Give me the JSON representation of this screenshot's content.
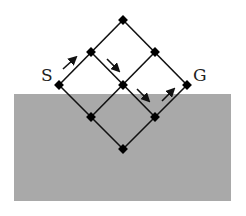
{
  "diagram": {
    "labels": {
      "start": "S",
      "goal": "G"
    },
    "colors": {
      "region": "#a9a9a9",
      "line": "#111111",
      "node": "#000000",
      "background": "#ffffff"
    },
    "region": {
      "x": 14,
      "y": 94,
      "width": 217,
      "height": 107
    },
    "nodes": [
      {
        "id": "top",
        "x": 123,
        "y": 20
      },
      {
        "id": "ml",
        "x": 91,
        "y": 52
      },
      {
        "id": "mr",
        "x": 155,
        "y": 52
      },
      {
        "id": "S",
        "x": 59,
        "y": 85
      },
      {
        "id": "c",
        "x": 123,
        "y": 85
      },
      {
        "id": "G",
        "x": 187,
        "y": 85
      },
      {
        "id": "ll",
        "x": 91,
        "y": 117
      },
      {
        "id": "lr",
        "x": 155,
        "y": 117
      },
      {
        "id": "bot",
        "x": 123,
        "y": 149
      }
    ],
    "path_arrows": [
      "S→ml",
      "ml→c",
      "c→lr",
      "lr→G"
    ]
  }
}
